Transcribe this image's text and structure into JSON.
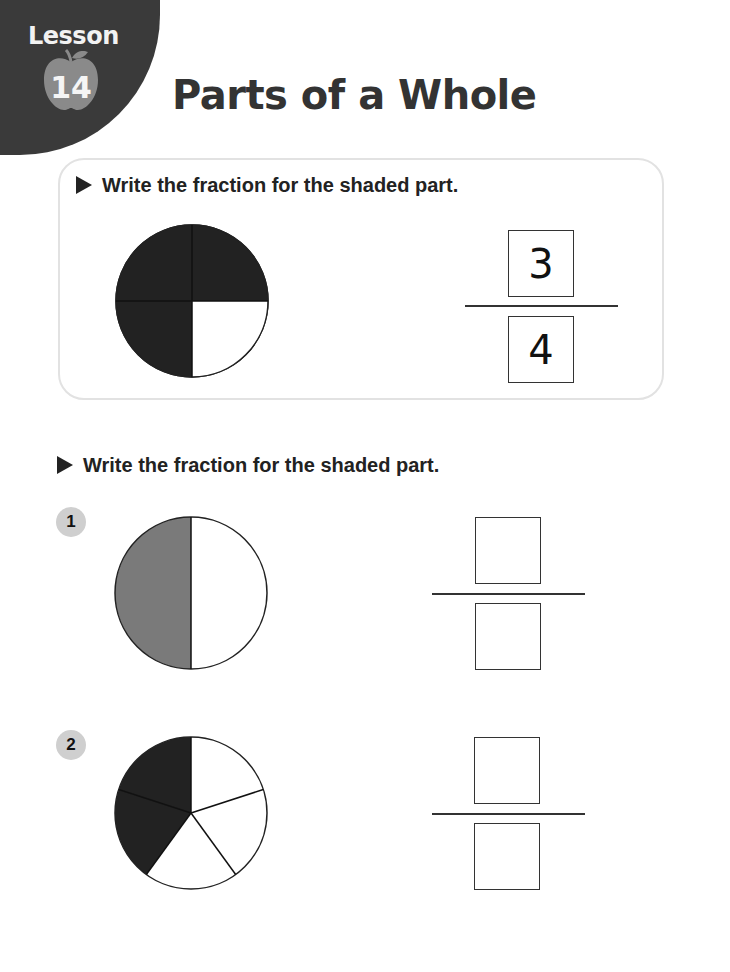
{
  "header": {
    "lesson_label": "Lesson",
    "lesson_number": "14",
    "title": "Parts of a Whole",
    "icon": "apple-icon"
  },
  "example": {
    "instruction": "Write the fraction for the shaded part.",
    "figure": {
      "shape": "circle",
      "parts": 4,
      "shaded": 3,
      "shade_color": "#222222"
    },
    "answer": {
      "numerator": "3",
      "denominator": "4"
    }
  },
  "section": {
    "instruction": "Write the fraction for the shaded part."
  },
  "problems": [
    {
      "number": "1",
      "figure": {
        "shape": "circle",
        "parts": 2,
        "shaded": 1,
        "shade_color": "#7a7a7a"
      },
      "answer": {
        "numerator": "",
        "denominator": ""
      }
    },
    {
      "number": "2",
      "figure": {
        "shape": "circle",
        "parts": 5,
        "shaded": 2,
        "shade_color": "#222222"
      },
      "answer": {
        "numerator": "",
        "denominator": ""
      }
    }
  ],
  "colors": {
    "header_tab": "#3a3a3a",
    "apple": "#8a8a8a",
    "badge": "#cfcfcf",
    "box_border": "#e2e2e2"
  }
}
